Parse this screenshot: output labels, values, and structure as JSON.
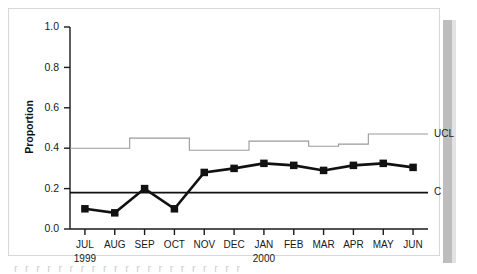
{
  "figure": {
    "caption_fragment": "r  r r  r r  r  r r r  r  r r r  r r  r  r r  r r r",
    "ucl_label": "UCL",
    "center_label": "C"
  },
  "chart_data": {
    "type": "line",
    "title": "",
    "xlabel": "",
    "ylabel": "Proportion",
    "ylim": [
      0.0,
      1.0
    ],
    "ytick_labels": [
      "0.0",
      "0.2",
      "0.4",
      "0.6",
      "0.8",
      "1.0"
    ],
    "ytick_values": [
      0.0,
      0.2,
      0.4,
      0.6,
      0.8,
      1.0
    ],
    "grid": false,
    "legend": "right-inline",
    "categories": [
      "JUL",
      "AUG",
      "SEP",
      "OCT",
      "NOV",
      "DEC",
      "JAN",
      "FEB",
      "MAR",
      "APR",
      "MAY",
      "JUN"
    ],
    "category_years": [
      {
        "index": 0,
        "year": "1999"
      },
      {
        "index": 6,
        "year": "2000"
      }
    ],
    "series": [
      {
        "name": "Proportion",
        "marker": "square",
        "values": [
          0.1,
          0.08,
          0.2,
          0.1,
          0.28,
          0.3,
          0.325,
          0.315,
          0.29,
          0.315,
          0.325,
          0.305
        ]
      },
      {
        "name": "UCL",
        "style": "step",
        "values": [
          0.4,
          0.4,
          0.45,
          0.45,
          0.39,
          0.39,
          0.435,
          0.435,
          0.41,
          0.42,
          0.47,
          0.47
        ]
      },
      {
        "name": "C",
        "style": "constant",
        "values": [
          0.18,
          0.18,
          0.18,
          0.18,
          0.18,
          0.18,
          0.18,
          0.18,
          0.18,
          0.18,
          0.18,
          0.18
        ]
      }
    ]
  },
  "colors": {
    "series": "#111111",
    "ucl": "#9a9a9a",
    "center": "#111111",
    "frame": "#d8d8d8",
    "shadow": "#bdbdbd"
  }
}
